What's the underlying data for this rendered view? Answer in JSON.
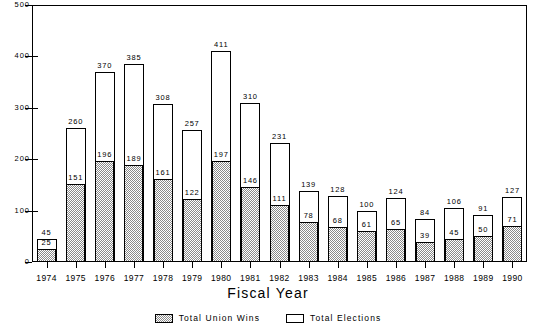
{
  "chart_data": {
    "type": "bar",
    "title": "",
    "subtitle": "",
    "xlabel": "Fiscal Year",
    "ylabel": "",
    "ylim": [
      0,
      500
    ],
    "yticks": [
      0,
      100,
      200,
      300,
      400,
      500
    ],
    "grid": false,
    "legend_position": "bottom-center",
    "bar_style": "overlaid (union wins drawn inside total elections bar)",
    "categories": [
      "1974",
      "1975",
      "1976",
      "1977",
      "1978",
      "1979",
      "1980",
      "1981",
      "1982",
      "1983",
      "1984",
      "1985",
      "1986",
      "1987",
      "1988",
      "1989",
      "1990"
    ],
    "series": [
      {
        "name": "Total Elections",
        "fill": "white",
        "values": [
          45,
          260,
          370,
          385,
          308,
          257,
          411,
          310,
          231,
          139,
          128,
          100,
          124,
          84,
          106,
          91,
          127
        ]
      },
      {
        "name": "Total Union Wins",
        "fill": "hatched-gray",
        "values": [
          25,
          151,
          196,
          189,
          161,
          122,
          197,
          146,
          111,
          78,
          68,
          61,
          65,
          39,
          45,
          50,
          71
        ]
      }
    ]
  },
  "legend": {
    "items": [
      {
        "label": "Total Union Wins",
        "swatch": "hatched"
      },
      {
        "label": "Total Elections",
        "swatch": "white"
      }
    ]
  },
  "colors": {
    "axis": "#000000",
    "bar_outline": "#000000",
    "bar_fill_total": "#ffffff",
    "bar_fill_wins": "#8a8a8a",
    "background": "#ffffff"
  }
}
